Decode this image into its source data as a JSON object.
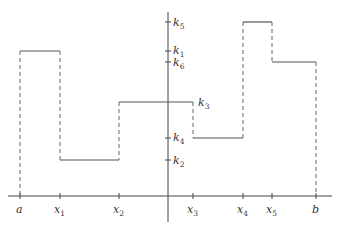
{
  "diagram": {
    "type": "step-function",
    "x_axis": {
      "ticks": [
        {
          "name": "a",
          "base": "a",
          "sub": ""
        },
        {
          "name": "x1",
          "base": "x",
          "sub": "1"
        },
        {
          "name": "x2",
          "base": "x",
          "sub": "2"
        },
        {
          "name": "x3",
          "base": "x",
          "sub": "3"
        },
        {
          "name": "x4",
          "base": "x",
          "sub": "4"
        },
        {
          "name": "x5",
          "base": "x",
          "sub": "5"
        },
        {
          "name": "b",
          "base": "b",
          "sub": ""
        }
      ]
    },
    "y_axis": {
      "ticks": [
        {
          "name": "k5",
          "base": "k",
          "sub": "5"
        },
        {
          "name": "k1",
          "base": "k",
          "sub": "1"
        },
        {
          "name": "k6",
          "base": "k",
          "sub": "6"
        },
        {
          "name": "k3",
          "base": "k",
          "sub": "3"
        },
        {
          "name": "k4",
          "base": "k",
          "sub": "4"
        },
        {
          "name": "k2",
          "base": "k",
          "sub": "2"
        }
      ]
    },
    "segments": [
      {
        "from": "a",
        "to": "x1",
        "value": "k1"
      },
      {
        "from": "x1",
        "to": "x2",
        "value": "k2"
      },
      {
        "from": "x2",
        "to": "x3",
        "value": "k3"
      },
      {
        "from": "x3",
        "to": "x4",
        "value": "k4"
      },
      {
        "from": "x4",
        "to": "x5",
        "value": "k5"
      },
      {
        "from": "x5",
        "to": "b",
        "value": "k6"
      }
    ]
  }
}
